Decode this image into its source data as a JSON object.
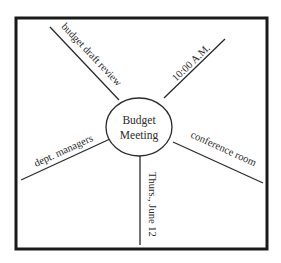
{
  "diagram": {
    "type": "web-organizer",
    "center": {
      "line1": "Budget",
      "line2": "Meeting"
    },
    "spokes": [
      {
        "id": "top-left",
        "label": "budget draft review"
      },
      {
        "id": "top-right",
        "label": "10:00 A.M."
      },
      {
        "id": "left",
        "label": "dept. managers"
      },
      {
        "id": "right",
        "label": "conference room"
      },
      {
        "id": "bottom",
        "label": "Thurs., June 12"
      }
    ]
  },
  "colors": {
    "frame": "#1a1a1a",
    "line": "#2a2a2a",
    "background": "#ffffff"
  }
}
